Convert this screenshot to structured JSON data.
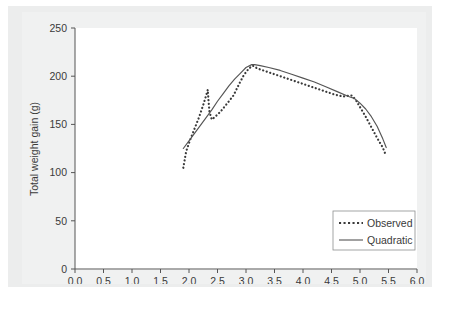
{
  "figure": {
    "background_color": "#eceded",
    "plot_background_color": "#ffffff",
    "axis_color": "#555555",
    "caption": ""
  },
  "chart_data": {
    "type": "line",
    "title": "",
    "subtitle": "",
    "xlabel": "Vagal tone",
    "ylabel": "Total weight gain (g)",
    "xlim": [
      0.0,
      6.0
    ],
    "ylim": [
      0,
      250
    ],
    "xticks": [
      "0.0",
      "0.5",
      "1.0",
      "1.5",
      "2.0",
      "2.5",
      "3.0",
      "3.5",
      "4.0",
      "4.5",
      "5.0",
      "5.5",
      "6.0"
    ],
    "xtick_values": [
      0.0,
      0.5,
      1.0,
      1.5,
      2.0,
      2.5,
      3.0,
      3.5,
      4.0,
      4.5,
      5.0,
      5.5,
      6.0
    ],
    "yticks": [
      "0",
      "50",
      "100",
      "150",
      "200",
      "250"
    ],
    "ytick_values": [
      0,
      50,
      100,
      150,
      200,
      250
    ],
    "grid": false,
    "legend_position": "lower right",
    "series": [
      {
        "name": "Observed",
        "style": "dotted",
        "color": "#3a3a3a",
        "x": [
          1.9,
          1.95,
          2.02,
          2.1,
          2.18,
          2.26,
          2.33,
          2.34,
          2.36,
          2.4,
          2.46,
          2.55,
          2.66,
          2.78,
          2.88,
          2.96,
          3.05,
          3.12,
          3.2,
          3.35,
          3.5,
          3.65,
          3.8,
          3.95,
          4.1,
          4.25,
          4.4,
          4.55,
          4.7,
          4.85,
          4.92,
          5.0,
          5.1,
          5.2,
          5.3,
          5.4,
          5.44
        ],
        "y": [
          105,
          122,
          134,
          146,
          158,
          172,
          186,
          176,
          163,
          155,
          158,
          163,
          171,
          180,
          192,
          201,
          208,
          211,
          208,
          205,
          202,
          199,
          196,
          193,
          190,
          187,
          184,
          181,
          179,
          180,
          176,
          168,
          158,
          147,
          136,
          126,
          120
        ]
      },
      {
        "name": "Quadratic",
        "style": "solid",
        "color": "#555555",
        "x": [
          1.9,
          2.0,
          2.1,
          2.2,
          2.3,
          2.4,
          2.5,
          2.6,
          2.7,
          2.8,
          2.9,
          3.0,
          3.1,
          3.15,
          3.25,
          3.4,
          3.6,
          3.8,
          4.0,
          4.2,
          4.4,
          4.6,
          4.8,
          4.9,
          5.0,
          5.1,
          5.2,
          5.3,
          5.4,
          5.46
        ],
        "y": [
          125,
          133,
          141,
          149,
          157,
          165,
          174,
          182,
          190,
          197,
          203,
          209,
          212,
          212,
          211,
          209,
          206,
          202,
          198,
          194,
          189,
          184,
          179,
          177,
          172,
          166,
          158,
          148,
          135,
          126
        ]
      }
    ],
    "annotations": []
  },
  "legend": {
    "entries": [
      {
        "label": "Observed",
        "style": "dotted"
      },
      {
        "label": "Quadratic",
        "style": "solid"
      }
    ]
  }
}
